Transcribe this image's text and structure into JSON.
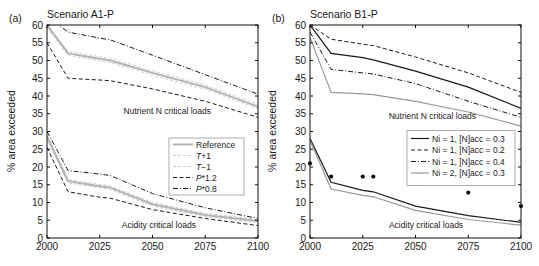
{
  "figure_type": "two-panel line chart, critical loads exceedance scenarios",
  "chart_data": [
    {
      "type": "line",
      "panel": "a",
      "tag": "(a)",
      "title": "Scenario A1-P",
      "ylabel": "% area exceeded",
      "xlabel": "",
      "xlim": [
        2000,
        2100
      ],
      "ylim": [
        0,
        60
      ],
      "x_ticks": [
        2000,
        2025,
        2050,
        2075,
        2100
      ],
      "y_tick_step": 5,
      "grid": false,
      "x": [
        2000,
        2010,
        2025,
        2030,
        2050,
        2075,
        2100
      ],
      "series": [
        {
          "name": "P*0.8 nutrient",
          "group": "Nutrient N critical loads",
          "color": "#1a1a1a",
          "width": 1,
          "dash": "5,2,1,2",
          "values": [
            62.5,
            58,
            56.3,
            55.8,
            51.5,
            46,
            40.5
          ]
        },
        {
          "name": "T+1 nutrient",
          "group": "Nutrient N critical loads",
          "color": "#cccccc",
          "width": 1,
          "dash": "3,2",
          "values": [
            60,
            52.6,
            51.1,
            50.6,
            47.1,
            43.1,
            37.6
          ]
        },
        {
          "name": "T-1 nutrient",
          "group": "Nutrient N critical loads",
          "color": "#cccccc",
          "width": 1,
          "dash": "3,2",
          "values": [
            59.3,
            51.4,
            49.9,
            49.4,
            45.9,
            41.9,
            36.4
          ]
        },
        {
          "name": "Reference nutrient",
          "group": "Nutrient N critical loads",
          "color": "#b3b3b3",
          "width": 2,
          "dash": "",
          "values": [
            60,
            52,
            50.5,
            50,
            46.5,
            42.5,
            37
          ]
        },
        {
          "name": "P*1.2 nutrient",
          "group": "Nutrient N critical loads",
          "color": "#1a1a1a",
          "width": 1,
          "dash": "4,2.5",
          "values": [
            55,
            45,
            44.5,
            44.3,
            42,
            38.5,
            34
          ]
        },
        {
          "name": "P*0.8 acidity",
          "group": "Acidity critical loads",
          "color": "#1a1a1a",
          "width": 1,
          "dash": "5,2,1,2",
          "values": [
            30,
            19,
            18,
            17.6,
            12.5,
            8.5,
            5.5
          ]
        },
        {
          "name": "T+1 acidity",
          "group": "Acidity critical loads",
          "color": "#cccccc",
          "width": 1,
          "dash": "3,2",
          "values": [
            29,
            16.5,
            15.1,
            14.7,
            10,
            7,
            5.2
          ]
        },
        {
          "name": "T-1 acidity",
          "group": "Acidity critical loads",
          "color": "#cccccc",
          "width": 1,
          "dash": "3,2",
          "values": [
            28,
            15.5,
            14.1,
            13.7,
            9,
            6,
            4.4
          ]
        },
        {
          "name": "Reference acidity",
          "group": "Acidity critical loads",
          "color": "#b3b3b3",
          "width": 2,
          "dash": "",
          "values": [
            28.5,
            16,
            14.6,
            14.2,
            9.5,
            6.5,
            4.8
          ]
        },
        {
          "name": "P*1.2 acidity",
          "group": "Acidity critical loads",
          "color": "#1a1a1a",
          "width": 1,
          "dash": "4,2.5",
          "values": [
            25.5,
            13,
            11.5,
            11.2,
            8,
            5.5,
            3.5
          ]
        }
      ],
      "annotations": [
        {
          "text": "Nutrient N critical loads",
          "x": 2057,
          "y": 34.8
        },
        {
          "text": "Acidity critical loads",
          "x": 2053,
          "y": 2.9
        }
      ],
      "legend": {
        "entries": [
          {
            "segments": [
              {
                "t": "Reference",
                "i": false
              }
            ],
            "color": "#b3b3b3",
            "width": 2,
            "dash": ""
          },
          {
            "segments": [
              {
                "t": "T",
                "i": true
              },
              {
                "t": "+1",
                "i": false
              }
            ],
            "color": "#cccccc",
            "width": 1,
            "dash": "3,2"
          },
          {
            "segments": [
              {
                "t": "T",
                "i": true
              },
              {
                "t": "−1",
                "i": false
              }
            ],
            "color": "#cccccc",
            "width": 1,
            "dash": "3,2"
          },
          {
            "segments": [
              {
                "t": "P",
                "i": true
              },
              {
                "t": "*1.2",
                "i": false
              }
            ],
            "color": "#1a1a1a",
            "width": 1,
            "dash": "4,2.5"
          },
          {
            "segments": [
              {
                "t": "P",
                "i": true
              },
              {
                "t": "*0.8",
                "i": false
              }
            ],
            "color": "#1a1a1a",
            "width": 1,
            "dash": "5,2,1,2"
          }
        ]
      }
    },
    {
      "type": "line",
      "panel": "b",
      "tag": "(b)",
      "title": "Scenario B1-P",
      "ylabel": "% area exceeded",
      "xlabel": "",
      "xlim": [
        2000,
        2100
      ],
      "ylim": [
        0,
        60
      ],
      "x_ticks": [
        2000,
        2025,
        2050,
        2075,
        2100
      ],
      "y_tick_step": 5,
      "grid": false,
      "x": [
        2000,
        2010,
        2025,
        2030,
        2050,
        2075,
        2100
      ],
      "series": [
        {
          "name": "Ni=1 Nacc=0.2 nutrient",
          "group": "Nutrient N critical loads",
          "color": "#1a1a1a",
          "width": 1,
          "dash": "4,2.5",
          "values": [
            60,
            56,
            54.6,
            54.2,
            51,
            46.5,
            41
          ]
        },
        {
          "name": "Ni=1 Nacc=0.3 nutrient",
          "group": "Nutrient N critical loads",
          "color": "#1a1a1a",
          "width": 1.2,
          "dash": "",
          "values": [
            60,
            52,
            50.8,
            50.2,
            47,
            42.5,
            36.5
          ]
        },
        {
          "name": "Ni=1 Nacc=0.4 nutrient",
          "group": "Nutrient N critical loads",
          "color": "#1a1a1a",
          "width": 1,
          "dash": "5,2,1,2",
          "values": [
            58,
            47.5,
            46.5,
            46.2,
            43.5,
            38.5,
            34
          ]
        },
        {
          "name": "Ni=2 Nacc=0.3 nutrient",
          "group": "Nutrient N critical loads",
          "color": "#999999",
          "width": 1.2,
          "dash": "",
          "values": [
            56.5,
            41,
            40.6,
            40.4,
            38.5,
            35.5,
            31.5
          ]
        },
        {
          "name": "Ni=1 Nacc=0.3 acidity",
          "group": "Acidity critical loads",
          "color": "#1a1a1a",
          "width": 1.2,
          "dash": "",
          "values": [
            28,
            15.7,
            13.4,
            13,
            9,
            6.3,
            4.4
          ]
        },
        {
          "name": "Ni=2 Nacc=0.3 acidity",
          "group": "Acidity critical loads",
          "color": "#999999",
          "width": 1.2,
          "dash": "",
          "values": [
            27.5,
            13.8,
            12,
            11.6,
            7.8,
            5.2,
            3.6
          ]
        }
      ],
      "scatter": {
        "name": "observation dots",
        "color": "#111111",
        "x": [
          2000,
          2010,
          2025,
          2030,
          2050,
          2075,
          2100
        ],
        "y": [
          21,
          17.3,
          17.3,
          17.3,
          15.3,
          12.8,
          9
        ]
      },
      "annotations": [
        {
          "text": "Nutrient N critical loads",
          "x": 2058,
          "y": 33.6
        },
        {
          "text": "Acidity critical loads",
          "x": 2055,
          "y": 2.9
        }
      ],
      "legend": {
        "entries": [
          {
            "segments": [
              {
                "t": "Ni = 1, [N]acc = 0.3",
                "i": false
              }
            ],
            "color": "#1a1a1a",
            "width": 1.2,
            "dash": ""
          },
          {
            "segments": [
              {
                "t": "Ni = 1, [N]acc = 0.2",
                "i": false
              }
            ],
            "color": "#1a1a1a",
            "width": 1,
            "dash": "4,2.5"
          },
          {
            "segments": [
              {
                "t": "Ni = 1, [N]acc = 0.4",
                "i": false
              }
            ],
            "color": "#1a1a1a",
            "width": 1,
            "dash": "5,2,1,2"
          },
          {
            "segments": [
              {
                "t": "Ni = 2, [N]acc = 0.3",
                "i": false
              }
            ],
            "color": "#999999",
            "width": 1.2,
            "dash": ""
          }
        ]
      }
    }
  ]
}
